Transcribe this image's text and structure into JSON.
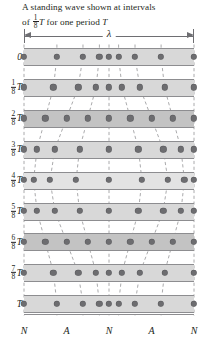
{
  "caption": {
    "line1": "A standing wave shown at intervals",
    "line2_pre": "of ",
    "line2_frac_num": "1",
    "line2_frac_den": "8",
    "line2_mid": "T",
    "line2_post": " for one period ",
    "line2_end": "T"
  },
  "wavelength_label": "λ",
  "axis": {
    "position_labels": [
      "N",
      "A",
      "N",
      "A",
      "N"
    ],
    "position_label_x_frac": [
      0.0,
      0.25,
      0.5,
      0.75,
      1.0
    ]
  },
  "time_labels": [
    {
      "text": "0",
      "num": "",
      "den": "",
      "sym": ""
    },
    {
      "text": "",
      "num": "1",
      "den": "8",
      "sym": "T"
    },
    {
      "text": "",
      "num": "2",
      "den": "8",
      "sym": "T"
    },
    {
      "text": "",
      "num": "3",
      "den": "8",
      "sym": "T"
    },
    {
      "text": "",
      "num": "4",
      "den": "8",
      "sym": "T"
    },
    {
      "text": "",
      "num": "5",
      "den": "8",
      "sym": "T"
    },
    {
      "text": "",
      "num": "6",
      "den": "8",
      "sym": "T"
    },
    {
      "text": "",
      "num": "7",
      "den": "8",
      "sym": "T"
    },
    {
      "text": "T",
      "num": "",
      "den": "",
      "sym": ""
    }
  ],
  "colors": {
    "band": "#d8d8d8",
    "band_dark": "#c3c3c3",
    "band_light": "#e3e3e3",
    "dot": "#6d6d70",
    "line": "#8d8d90",
    "text": "#231f20",
    "dash": "#a0a0a3"
  },
  "chart_data": {
    "type": "scatter",
    "xlabel": "",
    "ylabel": "time",
    "n_particles": 9,
    "n_rows": 9,
    "amplitude_frac_of_spacing": 1.55,
    "equilibrium_x_frac": [
      0,
      0.125,
      0.25,
      0.375,
      0.5,
      0.625,
      0.75,
      0.875,
      1.0
    ],
    "xlim": [
      0,
      1
    ],
    "grid": true,
    "legend": "none",
    "series": [
      {
        "name": "t = 0",
        "time_frac": 0.0,
        "phase_cos": 1.0,
        "x": [
          0.0,
          0.125,
          0.25,
          0.375,
          0.5,
          0.625,
          0.75,
          0.875,
          1.0
        ]
      },
      {
        "name": "t = T/8",
        "time_frac": 0.125,
        "phase_cos": 0.7071,
        "x": [
          0.0,
          0.125,
          0.25,
          0.375,
          0.5,
          0.625,
          0.75,
          0.875,
          1.0
        ]
      },
      {
        "name": "t = 2T/8",
        "time_frac": 0.25,
        "phase_cos": 0.0,
        "x": [
          0.0,
          0.125,
          0.25,
          0.375,
          0.5,
          0.625,
          0.75,
          0.875,
          1.0
        ]
      },
      {
        "name": "t = 3T/8",
        "time_frac": 0.375,
        "phase_cos": -0.7071,
        "x": [
          0.0,
          0.125,
          0.25,
          0.375,
          0.5,
          0.625,
          0.75,
          0.875,
          1.0
        ]
      },
      {
        "name": "t = 4T/8",
        "time_frac": 0.5,
        "phase_cos": -1.0,
        "x": [
          0.0,
          0.125,
          0.25,
          0.375,
          0.5,
          0.625,
          0.75,
          0.875,
          1.0
        ]
      },
      {
        "name": "t = 5T/8",
        "time_frac": 0.625,
        "phase_cos": -0.7071,
        "x": [
          0.0,
          0.125,
          0.25,
          0.375,
          0.5,
          0.625,
          0.75,
          0.875,
          1.0
        ]
      },
      {
        "name": "t = 6T/8",
        "time_frac": 0.75,
        "phase_cos": 0.0,
        "x": [
          0.0,
          0.125,
          0.25,
          0.375,
          0.5,
          0.625,
          0.75,
          0.875,
          1.0
        ]
      },
      {
        "name": "t = 7T/8",
        "time_frac": 0.875,
        "phase_cos": 0.7071,
        "x": [
          0.0,
          0.125,
          0.25,
          0.375,
          0.5,
          0.625,
          0.75,
          0.875,
          1.0
        ]
      },
      {
        "name": "t = T",
        "time_frac": 1.0,
        "phase_cos": 1.0,
        "x": [
          0.0,
          0.125,
          0.25,
          0.375,
          0.5,
          0.625,
          0.75,
          0.875,
          1.0
        ]
      }
    ],
    "row_shade": [
      "band",
      "band",
      "dark",
      "band",
      "light",
      "band",
      "dark",
      "band",
      "band"
    ]
  },
  "geometry": {
    "plot_left": 24,
    "plot_top": 44,
    "plot_w": 170,
    "plot_h": 277,
    "row_pitch": 30.9,
    "row_first_center": 12.5,
    "band_h": 17.0,
    "dot_r": 2.7
  }
}
